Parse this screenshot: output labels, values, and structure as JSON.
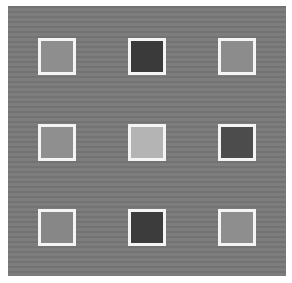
{
  "image": {
    "description": "Gray textured panel with a 3x3 grid of white-bordered gray swatches",
    "background_color": "#797979",
    "border_color": "#f4f4f4"
  },
  "swatches": [
    {
      "row": 1,
      "col": 1,
      "color": "#8e8e8e",
      "x": 30,
      "y": 32
    },
    {
      "row": 1,
      "col": 2,
      "color": "#3a3a3a",
      "x": 120,
      "y": 32
    },
    {
      "row": 1,
      "col": 3,
      "color": "#8c8c8c",
      "x": 210,
      "y": 32
    },
    {
      "row": 2,
      "col": 1,
      "color": "#8f8f8f",
      "x": 30,
      "y": 118
    },
    {
      "row": 2,
      "col": 2,
      "color": "#b4b4b4",
      "x": 120,
      "y": 118
    },
    {
      "row": 2,
      "col": 3,
      "color": "#4c4c4c",
      "x": 210,
      "y": 118
    },
    {
      "row": 3,
      "col": 1,
      "color": "#878787",
      "x": 30,
      "y": 203
    },
    {
      "row": 3,
      "col": 2,
      "color": "#3c3c3c",
      "x": 120,
      "y": 203
    },
    {
      "row": 3,
      "col": 3,
      "color": "#8e8e8e",
      "x": 210,
      "y": 203
    }
  ]
}
